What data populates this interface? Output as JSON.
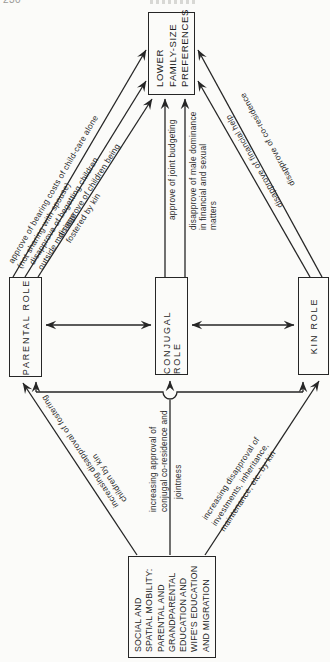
{
  "page": {
    "number": "230"
  },
  "nodes": {
    "preferences": {
      "label": "LOWER\nFAMILY-SIZE\nPREFERENCES"
    },
    "parental": {
      "label": "PARENTAL ROLE"
    },
    "conjugal": {
      "label": "CONJUGAL ROLE"
    },
    "kin": {
      "label": "KIN ROLE"
    },
    "social": {
      "label": "SOCIAL AND\nSPATIAL MOBILITY:\nPARENTAL AND\nGRANDPARENTAL\nEDUCATION AND\nWIFE'S EDUCATION\nAND MIGRATION"
    }
  },
  "edge_labels": {
    "bearing_costs": "approve of bearing costs of child-care alone\n(not sharing with spouse)",
    "begetting": "disapprove of begetting children\noutside marriage",
    "fostered": "disapprove of children being\nfostered by kin",
    "joint_budgeting": "approve of joint budgeting",
    "male_dominance": "disapprove of male dominance\nin financial and sexual\nmatters",
    "financial_help": "disapprove of financial help",
    "co_residence": "disapprove of co-residence",
    "fostering_kin": "increasing disapproval of fostering\nchildren by kin",
    "conjugal_jointness": "increasing approval of\nconjugal co-residence and",
    "jointness": "jointness",
    "investments": "increasing disapproval of\ninvestments, inheritance,\nmaintenance, etc. by kin"
  },
  "colors": {
    "ink": "#262626",
    "paper": "#fbfbf9"
  }
}
